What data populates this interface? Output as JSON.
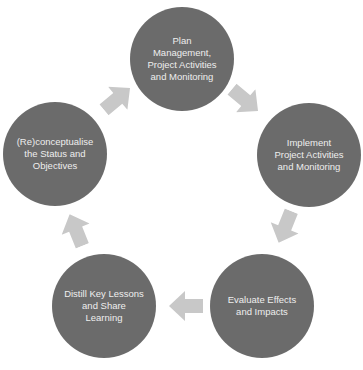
{
  "diagram": {
    "type": "cycle",
    "colors": {
      "node_fill": "#6b6b6b",
      "node_text": "#eeeeee",
      "arrow_fill": "#c8c8c8",
      "background": "#ffffff"
    },
    "nodes": [
      {
        "id": "plan",
        "label": "Plan\nManagement,\nProject Activities\nand Monitoring"
      },
      {
        "id": "implement",
        "label": "Implement\nProject Activities\nand Monitoring"
      },
      {
        "id": "evaluate",
        "label": "Evaluate Effects\nand Impacts"
      },
      {
        "id": "distill",
        "label": "Distill Key Lessons\nand Share\nLearning"
      },
      {
        "id": "reconceptualise",
        "label": "(Re)conceptualise\nthe Status and\nObjectives"
      }
    ],
    "arrows": [
      {
        "from": "plan",
        "to": "implement",
        "icon": "arrow-down-right-icon"
      },
      {
        "from": "implement",
        "to": "evaluate",
        "icon": "arrow-down-left-icon"
      },
      {
        "from": "evaluate",
        "to": "distill",
        "icon": "arrow-left-icon"
      },
      {
        "from": "distill",
        "to": "reconceptualise",
        "icon": "arrow-up-icon"
      },
      {
        "from": "reconceptualise",
        "to": "plan",
        "icon": "arrow-up-right-icon"
      }
    ]
  }
}
